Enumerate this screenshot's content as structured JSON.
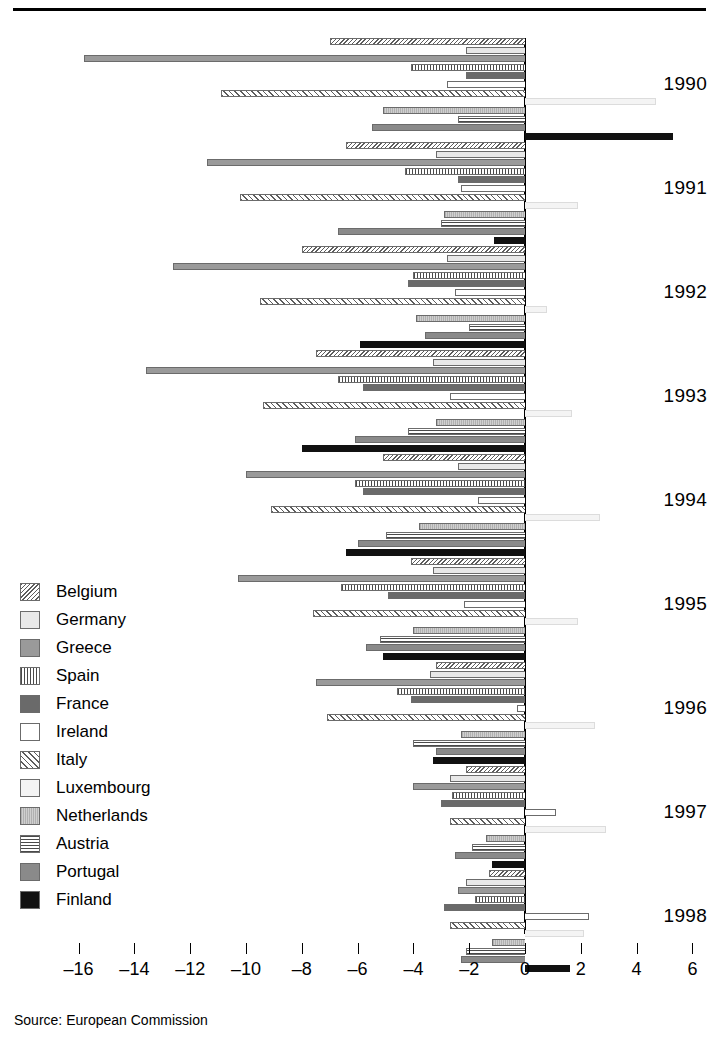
{
  "title_partial": "",
  "source": {
    "text": "Source: European Commission"
  },
  "legend": {
    "position": "left-middle",
    "items": [
      {
        "label": "Belgium",
        "key": "be",
        "swatch": "diagonal-hatch-backward"
      },
      {
        "label": "Germany",
        "key": "de",
        "swatch": "light-grey-solid"
      },
      {
        "label": "Greece",
        "key": "gr",
        "swatch": "medium-grey-solid"
      },
      {
        "label": "Spain",
        "key": "es",
        "swatch": "vertical-lines"
      },
      {
        "label": "France",
        "key": "fr",
        "swatch": "dark-grey-solid"
      },
      {
        "label": "Ireland",
        "key": "ie",
        "swatch": "white-solid"
      },
      {
        "label": "Italy",
        "key": "it",
        "swatch": "diagonal-hatch-forward"
      },
      {
        "label": "Luxembourg",
        "key": "lu",
        "swatch": "near-white-solid"
      },
      {
        "label": "Netherlands",
        "key": "nl",
        "swatch": "pale-grey-speckle"
      },
      {
        "label": "Austria",
        "key": "at",
        "swatch": "horizontal-lines"
      },
      {
        "label": "Portugal",
        "key": "pt",
        "swatch": "grey-solid"
      },
      {
        "label": "Finland",
        "key": "fi",
        "swatch": "black-solid"
      }
    ]
  },
  "axis": {
    "ticks": [
      -16,
      -14,
      -12,
      -10,
      -8,
      -6,
      -4,
      -2,
      0,
      2,
      4,
      6
    ],
    "tick_labels": [
      "–16",
      "–14",
      "–12",
      "–10",
      "–8",
      "–6",
      "–4",
      "–2",
      "0",
      "2",
      "4",
      "6"
    ],
    "min": -17.5,
    "max": 7.0,
    "zero_value": 0
  },
  "chart_data": {
    "type": "bar",
    "orientation": "horizontal",
    "title": "",
    "xlabel": "",
    "ylabel": "",
    "xlim": [
      -17.5,
      7.0
    ],
    "grid": false,
    "legend_position": "left-middle",
    "categories": [
      "1990",
      "1991",
      "1992",
      "1993",
      "1994",
      "1995",
      "1996",
      "1997",
      "1998"
    ],
    "series": [
      {
        "name": "Belgium",
        "key": "be",
        "values": [
          -7.0,
          -6.4,
          -8.0,
          -7.5,
          -5.1,
          -4.1,
          -3.2,
          -2.1,
          -1.3
        ]
      },
      {
        "name": "Germany",
        "key": "de",
        "values": [
          -2.1,
          -3.2,
          -2.8,
          -3.3,
          -2.4,
          -3.3,
          -3.4,
          -2.7,
          -2.1
        ]
      },
      {
        "name": "Greece",
        "key": "gr",
        "values": [
          -15.8,
          -11.4,
          -12.6,
          -13.6,
          -10.0,
          -10.3,
          -7.5,
          -4.0,
          -2.4
        ]
      },
      {
        "name": "Spain",
        "key": "es",
        "values": [
          -4.1,
          -4.3,
          -4.0,
          -6.7,
          -6.1,
          -6.6,
          -4.6,
          -2.6,
          -1.8
        ]
      },
      {
        "name": "France",
        "key": "fr",
        "values": [
          -2.1,
          -2.4,
          -4.2,
          -5.8,
          -5.8,
          -4.9,
          -4.1,
          -3.0,
          -2.9
        ]
      },
      {
        "name": "Ireland",
        "key": "ie",
        "values": [
          -2.8,
          -2.3,
          -2.5,
          -2.7,
          -1.7,
          -2.2,
          -0.3,
          1.1,
          2.3
        ]
      },
      {
        "name": "Italy",
        "key": "it",
        "values": [
          -10.9,
          -10.2,
          -9.5,
          -9.4,
          -9.1,
          -7.6,
          -7.1,
          -2.7,
          -2.7
        ]
      },
      {
        "name": "Luxembourg",
        "key": "lu",
        "values": [
          4.7,
          1.9,
          0.8,
          1.7,
          2.7,
          1.9,
          2.5,
          2.9,
          2.1
        ]
      },
      {
        "name": "Netherlands",
        "key": "nl",
        "values": [
          -5.1,
          -2.9,
          -3.9,
          -3.2,
          -3.8,
          -4.0,
          -2.3,
          -1.4,
          -1.2
        ]
      },
      {
        "name": "Austria",
        "key": "at",
        "values": [
          -2.4,
          -3.0,
          -2.0,
          -4.2,
          -5.0,
          -5.2,
          -4.0,
          -1.9,
          -2.1
        ]
      },
      {
        "name": "Portugal",
        "key": "pt",
        "values": [
          -5.5,
          -6.7,
          -3.6,
          -6.1,
          -6.0,
          -5.7,
          -3.2,
          -2.5,
          -2.3
        ]
      },
      {
        "name": "Finland",
        "key": "fi",
        "values": [
          5.3,
          -1.1,
          -5.9,
          -8.0,
          -6.4,
          -5.1,
          -3.3,
          -1.2,
          1.6
        ]
      }
    ]
  }
}
